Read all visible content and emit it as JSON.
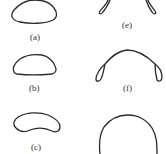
{
  "figure": {
    "stroke_color": "#2a2a2a",
    "panels": [
      {
        "id": "a",
        "label": "(a)",
        "shape": "rounded-oval"
      },
      {
        "id": "b",
        "label": "(b)",
        "shape": "dome-flat-bottom"
      },
      {
        "id": "c",
        "label": "(c)",
        "shape": "kidney-bean"
      },
      {
        "id": "e",
        "label": "(e)",
        "shape": "two-lobes"
      },
      {
        "id": "f",
        "label": "(f)",
        "shape": "arch-with-lobes"
      },
      {
        "id": "g",
        "label": "",
        "shape": "open-arch"
      }
    ]
  }
}
